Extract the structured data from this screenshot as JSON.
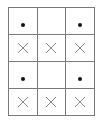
{
  "grid": {
    "rows": 4,
    "cols": 3,
    "cells": [
      [
        "dot",
        "empty",
        "dot"
      ],
      [
        "cross",
        "cross",
        "cross"
      ],
      [
        "dot",
        "empty",
        "dot"
      ],
      [
        "cross",
        "cross",
        "cross"
      ]
    ]
  },
  "colors": {
    "border": "#7a7a7a",
    "dot": "#111111",
    "cross": "#888888"
  }
}
